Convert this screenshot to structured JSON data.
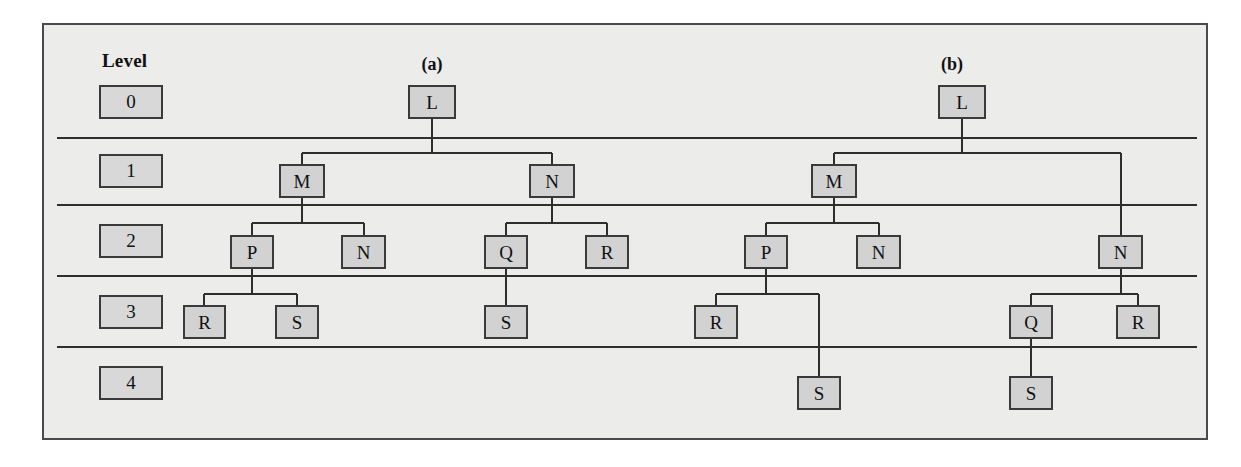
{
  "figure": {
    "level_header": "Level",
    "panel_a_label": "(a)",
    "panel_b_label": "(b)",
    "level_labels": [
      "0",
      "1",
      "2",
      "3",
      "4"
    ]
  },
  "tree_a": {
    "nodes": [
      {
        "id": "a-l",
        "label": "L",
        "level": 0
      },
      {
        "id": "a-m",
        "label": "M",
        "level": 1
      },
      {
        "id": "a-n1",
        "label": "N",
        "level": 1
      },
      {
        "id": "a-p",
        "label": "P",
        "level": 2
      },
      {
        "id": "a-n2",
        "label": "N",
        "level": 2
      },
      {
        "id": "a-q",
        "label": "Q",
        "level": 2
      },
      {
        "id": "a-r1",
        "label": "R",
        "level": 2
      },
      {
        "id": "a-r2",
        "label": "R",
        "level": 3
      },
      {
        "id": "a-s1",
        "label": "S",
        "level": 3
      },
      {
        "id": "a-s2",
        "label": "S",
        "level": 3
      }
    ],
    "edges": [
      [
        "a-l",
        "a-m"
      ],
      [
        "a-l",
        "a-n1"
      ],
      [
        "a-m",
        "a-p"
      ],
      [
        "a-m",
        "a-n2"
      ],
      [
        "a-n1",
        "a-q"
      ],
      [
        "a-n1",
        "a-r1"
      ],
      [
        "a-p",
        "a-r2"
      ],
      [
        "a-p",
        "a-s1"
      ],
      [
        "a-q",
        "a-s2"
      ]
    ]
  },
  "tree_b": {
    "nodes": [
      {
        "id": "b-l",
        "label": "L",
        "level": 0
      },
      {
        "id": "b-m",
        "label": "M",
        "level": 1
      },
      {
        "id": "b-p",
        "label": "P",
        "level": 2
      },
      {
        "id": "b-n1",
        "label": "N",
        "level": 2
      },
      {
        "id": "b-n2",
        "label": "N",
        "level": 2
      },
      {
        "id": "b-r1",
        "label": "R",
        "level": 3
      },
      {
        "id": "b-q",
        "label": "Q",
        "level": 3
      },
      {
        "id": "b-r2",
        "label": "R",
        "level": 3
      },
      {
        "id": "b-s1",
        "label": "S",
        "level": 4
      },
      {
        "id": "b-s2",
        "label": "S",
        "level": 4
      }
    ],
    "edges": [
      [
        "b-l",
        "b-m"
      ],
      [
        "b-l",
        "b-n2"
      ],
      [
        "b-m",
        "b-p"
      ],
      [
        "b-m",
        "b-n1"
      ],
      [
        "b-p",
        "b-r1"
      ],
      [
        "b-p",
        "b-s1"
      ],
      [
        "b-n2",
        "b-q"
      ],
      [
        "b-n2",
        "b-r2"
      ],
      [
        "b-q",
        "b-s2"
      ]
    ]
  },
  "colors": {
    "frame_background": "#ececeb",
    "frame_border": "#4a4a4a",
    "node_fill": "#d2d2d2",
    "node_border": "#3a3a3a",
    "edge_line": "#2e2e2e"
  }
}
